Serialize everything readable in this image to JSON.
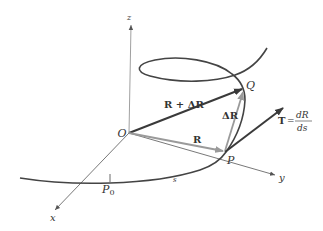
{
  "diagram": {
    "axes": {
      "x_label": "x",
      "y_label": "y",
      "z_label": "z"
    },
    "points": {
      "origin": "O",
      "p": "P",
      "q": "Q",
      "p0": "P",
      "p0_sub": "0"
    },
    "vectors": {
      "r": "R",
      "r_plus_dr": "R + ΔR",
      "dr": "ΔR",
      "tangent_lhs": "T",
      "tangent_eq": "=",
      "tangent_num": "dR",
      "tangent_den": "ds"
    },
    "arc_label": "s",
    "colors": {
      "curve": "#444444",
      "axis": "#666666",
      "vector_dark": "#3a3a3a",
      "vector_light": "#9a9a9a",
      "text": "#333333"
    }
  }
}
